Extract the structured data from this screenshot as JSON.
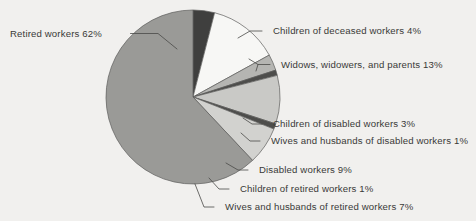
{
  "chart_data": {
    "type": "pie",
    "title": "",
    "subtitle": "",
    "xlabel": "",
    "ylabel": "",
    "legend_position": "callout-labels",
    "grid": false,
    "units": "percent",
    "total": 100,
    "categories": [
      "Children of deceased workers",
      "Widows, widowers, and parents",
      "Children of disabled workers",
      "Wives and husbands of disabled workers",
      "Disabled workers",
      "Children of retired workers",
      "Wives and husbands of retired workers",
      "Retired workers"
    ],
    "values": [
      4,
      13,
      3,
      1,
      9,
      1,
      7,
      62
    ],
    "slices": [
      {
        "label": "Children of deceased workers",
        "value": 4,
        "value_text": "4%",
        "color": "#3f3f3e",
        "start_deg": 0,
        "end_deg": 14.4
      },
      {
        "label": "Widows, widowers, and parents",
        "value": 13,
        "value_text": "13%",
        "color": "#f7f7f5",
        "start_deg": 14.4,
        "end_deg": 61.2
      },
      {
        "label": "Children of disabled workers",
        "value": 3,
        "value_text": "3%",
        "color": "#b5b5b2",
        "start_deg": 61.2,
        "end_deg": 72.0
      },
      {
        "label": "Wives and husbands of disabled workers",
        "value": 1,
        "value_text": "1%",
        "color": "#4d4d4b",
        "start_deg": 72.0,
        "end_deg": 75.6
      },
      {
        "label": "Disabled workers",
        "value": 9,
        "value_text": "9%",
        "color": "#c9c9c6",
        "start_deg": 75.6,
        "end_deg": 108.0
      },
      {
        "label": "Children of retired workers",
        "value": 1,
        "value_text": "1%",
        "color": "#4d4d4b",
        "start_deg": 108.0,
        "end_deg": 111.6
      },
      {
        "label": "Wives and husbands of retired workers",
        "value": 7,
        "value_text": "7%",
        "color": "#d2d2cf",
        "start_deg": 111.6,
        "end_deg": 136.8
      },
      {
        "label": "Retired workers",
        "value": 62,
        "value_text": "62%",
        "color": "#9a9a97",
        "start_deg": 136.8,
        "end_deg": 360.0
      }
    ],
    "callouts": [
      {
        "name": "retired-workers",
        "text": "Retired workers 62%"
      },
      {
        "name": "children-of-deceased-workers",
        "text": "Children of deceased workers 4%"
      },
      {
        "name": "widows-widowers-and-parents",
        "text": "Widows, widowers, and parents 13%"
      },
      {
        "name": "children-of-disabled-workers",
        "text": "Children of disabled workers 3%"
      },
      {
        "name": "wives-husbands-disabled-workers",
        "text": "Wives and husbands of disabled workers 1%"
      },
      {
        "name": "disabled-workers",
        "text": "Disabled workers 9%"
      },
      {
        "name": "children-of-retired-workers",
        "text": "Children of retired workers 1%"
      },
      {
        "name": "wives-husbands-retired-workers",
        "text": "Wives and husbands of retired workers 7%"
      }
    ],
    "colors": {
      "background": "#f1f0ee",
      "outline": "#5d5d5b",
      "text": "#3a3a38",
      "leader": "#4a4a48"
    }
  }
}
